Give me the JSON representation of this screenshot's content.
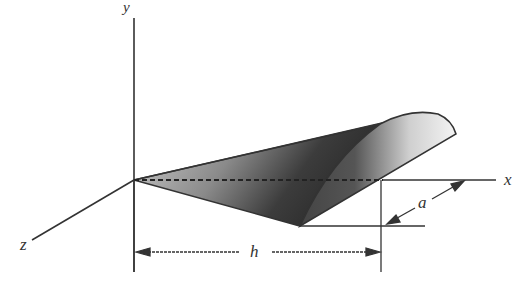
{
  "figure": {
    "axes": {
      "x_label": "x",
      "y_label": "y",
      "z_label": "z"
    },
    "dimensions": {
      "length_label": "h",
      "radius_label": "a"
    },
    "colors": {
      "line": "#333333",
      "shade_dark": "#3a3a3a",
      "shade_light": "#f2f2f2"
    }
  }
}
